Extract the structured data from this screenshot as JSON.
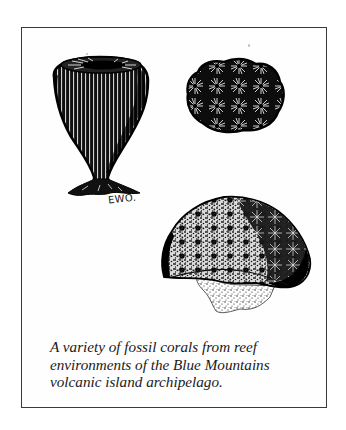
{
  "figure": {
    "illustrations": [
      {
        "name": "vase-shaped-fossil-coral",
        "description": "Vase/goblet-shaped solitary coral with vertical ribbing on a narrow stalk"
      },
      {
        "name": "massive-fossil-coral",
        "description": "Compact rounded coral colony with star-shaped corallites"
      },
      {
        "name": "hemispherical-fossil-coral",
        "description": "Dome-shaped coral colony with stippled base"
      }
    ],
    "artist_signature": "EWO.",
    "caption": {
      "lines": [
        "A variety of fossil corals from reef",
        "environments of the Blue Mountains",
        "volcanic island archipelago."
      ]
    }
  },
  "colors": {
    "ink": "#111111",
    "frame": "#3a3a3a",
    "paper": "#ffffff"
  }
}
